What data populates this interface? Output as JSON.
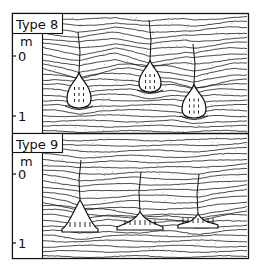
{
  "figure": {
    "panels": [
      {
        "label": "Type 8",
        "unit": "m",
        "ticks": [
          "0",
          "1"
        ],
        "structures": [
          {
            "kind": "drop",
            "cx": 79,
            "top": 72,
            "bottom": 108,
            "width": 24
          },
          {
            "kind": "drop",
            "cx": 150,
            "top": 60,
            "bottom": 92,
            "width": 22
          },
          {
            "kind": "drop",
            "cx": 194,
            "top": 84,
            "bottom": 118,
            "width": 24
          }
        ]
      },
      {
        "label": "Type 9",
        "unit": "m",
        "ticks": [
          "0",
          "1"
        ],
        "structures": [
          {
            "kind": "flame",
            "cx": 80,
            "top": 200,
            "bottom": 232,
            "width": 36
          },
          {
            "kind": "flame",
            "cx": 140,
            "top": 212,
            "bottom": 230,
            "width": 46
          },
          {
            "kind": "flame",
            "cx": 198,
            "top": 214,
            "bottom": 228,
            "width": 40
          }
        ]
      }
    ],
    "colors": {
      "ink": "#111111",
      "paper": "#ffffff"
    }
  }
}
